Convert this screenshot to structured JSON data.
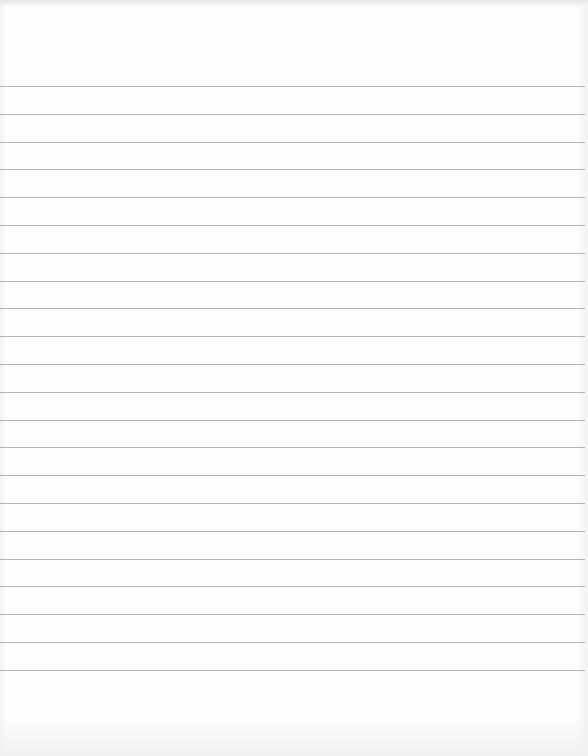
{
  "page": {
    "type": "lined-paper",
    "background_color": "#fdfdfd",
    "rule_color": "#a8a8a8",
    "rule_count": 22,
    "first_rule_y": 86,
    "rule_spacing": 27.8,
    "text": ""
  }
}
